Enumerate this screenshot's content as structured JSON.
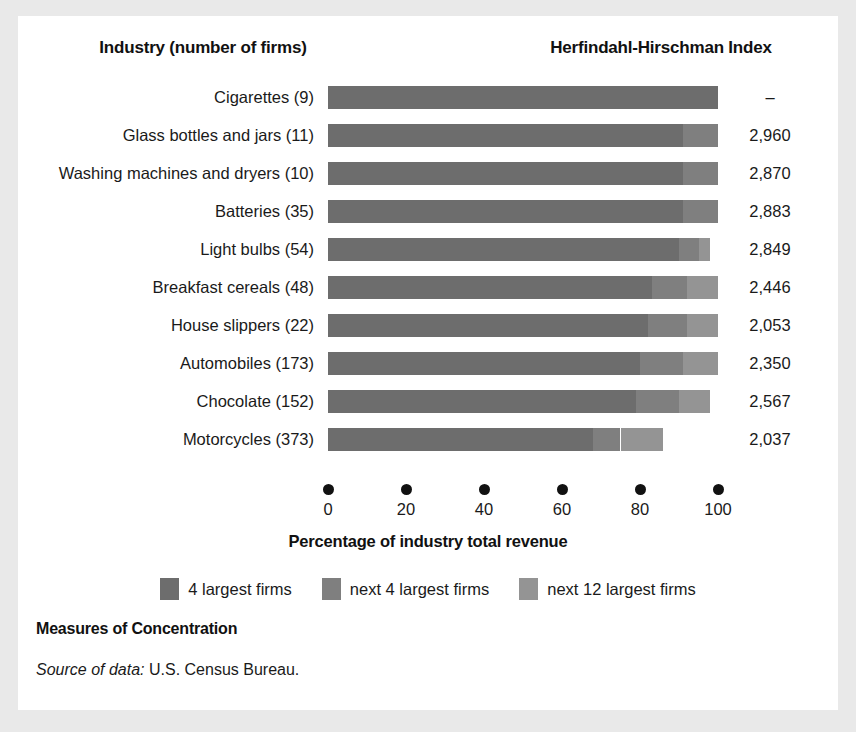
{
  "header": {
    "industry_label": "Industry (number of firms)",
    "hhi_label": "Herfindahl-Hirschman Index"
  },
  "footer": {
    "title": "Measures of Concentration",
    "source_prefix": "Source of data:",
    "source_text": "U.S. Census Bureau."
  },
  "legend": {
    "items": [
      {
        "label": "4 largest firms",
        "color": "#6d6d6d"
      },
      {
        "label": "next 4 largest firms",
        "color": "#7f7f7f"
      },
      {
        "label": "next 12 largest firms",
        "color": "#949494"
      }
    ]
  },
  "chart_data": {
    "type": "bar",
    "orientation": "horizontal",
    "stacked": true,
    "title": "Measures of Concentration",
    "xlabel": "Percentage of industry total revenue",
    "ylabel": "Industry (number of firms)",
    "xlim": [
      0,
      100
    ],
    "xticks": [
      0,
      20,
      40,
      60,
      80,
      100
    ],
    "xticklabels": [
      "0",
      "20",
      "40",
      "60",
      "80",
      "100"
    ],
    "grid": false,
    "legend_position": "bottom-center",
    "series": [
      {
        "name": "4 largest firms",
        "color": "#6d6d6d",
        "values": [
          100,
          91,
          91,
          91,
          90,
          83,
          82,
          80,
          79,
          68
        ]
      },
      {
        "name": "next 4 largest firms",
        "color": "#7f7f7f",
        "values": [
          0,
          9,
          9,
          9,
          5,
          9,
          10,
          11,
          11,
          7
        ]
      },
      {
        "name": "next 12 largest firms",
        "color": "#949494",
        "values": [
          0,
          0,
          0,
          0,
          3,
          8,
          8,
          9,
          8,
          11
        ]
      }
    ],
    "categories": [
      "Cigarettes  (9)",
      "Glass bottles and jars  (11)",
      "Washing machines and dryers  (10)",
      "Batteries  (35)",
      "Light bulbs  (54)",
      "Breakfast cereals  (48)",
      "House slippers  (22)",
      "Automobiles  (173)",
      "Chocolate  (152)",
      "Motorcycles  (373)"
    ],
    "annotations": {
      "hhi_column_header": "Herfindahl-Hirschman Index",
      "hhi_values": [
        "–",
        "2,960",
        "2,870",
        "2,883",
        "2,849",
        "2,446",
        "2,053",
        "2,350",
        "2,567",
        "2,037"
      ]
    },
    "rows": [
      {
        "label": "Cigarettes  (9)",
        "s1": 100,
        "s2": 0,
        "s3": 0,
        "hhi": "–"
      },
      {
        "label": "Glass bottles and jars  (11)",
        "s1": 91,
        "s2": 9,
        "s3": 0,
        "hhi": "2,960"
      },
      {
        "label": "Washing machines and dryers  (10)",
        "s1": 91,
        "s2": 9,
        "s3": 0,
        "hhi": "2,870"
      },
      {
        "label": "Batteries  (35)",
        "s1": 91,
        "s2": 9,
        "s3": 0,
        "hhi": "2,883"
      },
      {
        "label": "Light bulbs  (54)",
        "s1": 90,
        "s2": 5,
        "s3": 3,
        "hhi": "2,849"
      },
      {
        "label": "Breakfast cereals  (48)",
        "s1": 83,
        "s2": 9,
        "s3": 8,
        "hhi": "2,446"
      },
      {
        "label": "House slippers  (22)",
        "s1": 82,
        "s2": 10,
        "s3": 8,
        "hhi": "2,053"
      },
      {
        "label": "Automobiles  (173)",
        "s1": 80,
        "s2": 11,
        "s3": 9,
        "hhi": "2,350"
      },
      {
        "label": "Chocolate  (152)",
        "s1": 79,
        "s2": 11,
        "s3": 8,
        "hhi": "2,567"
      },
      {
        "label": "Motorcycles  (373)",
        "s1": 68,
        "s2": 7,
        "s3": 11,
        "hhi": "2,037"
      }
    ]
  }
}
